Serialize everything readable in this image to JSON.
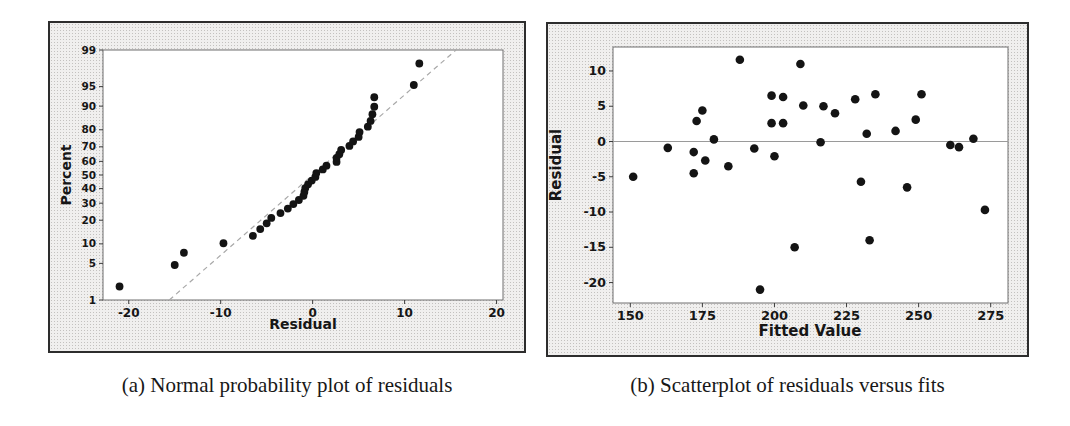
{
  "page": {
    "width": 1070,
    "height": 426,
    "background": "#ffffff"
  },
  "panels": {
    "a": {
      "caption": "(a) Normal probability plot of residuals"
    },
    "b": {
      "caption": "(b) Scatterplot of residuals versus fits"
    }
  },
  "style": {
    "panel_bg": "#f0efee",
    "panel_border": "#2d2d2d",
    "plot_bg": "#ffffff",
    "plot_border": "#6f6f6f",
    "point_color": "#141414",
    "ref_line_color": "#9a9a9a",
    "fit_line_color": "#a8a8a8",
    "tick_color": "#3c3c3c",
    "label_color": "#161616"
  },
  "chart_data": [
    {
      "id": "normal-probability-plot",
      "type": "scatter",
      "title": "",
      "xlabel": "Residual",
      "ylabel": "Percent",
      "y_scale": "normal-probability",
      "x_ticks": [
        -20,
        -10,
        0,
        10,
        20
      ],
      "y_ticks": [
        1,
        5,
        10,
        20,
        30,
        40,
        50,
        60,
        70,
        80,
        90,
        95,
        99
      ],
      "xlim": [
        -22.8,
        20.7
      ],
      "ylim_percent": [
        1,
        99
      ],
      "grid": false,
      "legend": "none",
      "fit_line": {
        "mean": 0,
        "sd": 6.7,
        "dashed": true
      },
      "point_format": [
        "residual",
        "percent"
      ],
      "points": [
        [
          -21.0,
          1.9
        ],
        [
          -15.0,
          4.7
        ],
        [
          -14.0,
          7.4
        ],
        [
          -9.7,
          10.2
        ],
        [
          -6.5,
          12.9
        ],
        [
          -5.7,
          15.7
        ],
        [
          -5.0,
          18.4
        ],
        [
          -4.5,
          21.2
        ],
        [
          -3.5,
          23.9
        ],
        [
          -2.7,
          26.6
        ],
        [
          -2.1,
          29.4
        ],
        [
          -1.5,
          32.1
        ],
        [
          -1.0,
          34.9
        ],
        [
          -0.9,
          37.6
        ],
        [
          -0.8,
          40.4
        ],
        [
          -0.5,
          43.1
        ],
        [
          -0.1,
          45.9
        ],
        [
          0.3,
          48.6
        ],
        [
          0.4,
          51.4
        ],
        [
          1.1,
          54.1
        ],
        [
          1.5,
          56.9
        ],
        [
          2.6,
          59.6
        ],
        [
          2.6,
          62.4
        ],
        [
          2.9,
          65.1
        ],
        [
          3.1,
          67.9
        ],
        [
          4.0,
          70.6
        ],
        [
          4.4,
          73.4
        ],
        [
          5.0,
          76.1
        ],
        [
          5.1,
          78.8
        ],
        [
          6.0,
          81.6
        ],
        [
          6.3,
          84.3
        ],
        [
          6.5,
          87.1
        ],
        [
          6.7,
          89.8
        ],
        [
          6.7,
          92.6
        ],
        [
          11.0,
          95.3
        ],
        [
          11.6,
          98.1
        ]
      ]
    },
    {
      "id": "residuals-versus-fits",
      "type": "scatter",
      "title": "",
      "xlabel": "Fitted Value",
      "ylabel": "Residual",
      "y_scale": "linear",
      "x_ticks": [
        150,
        175,
        200,
        225,
        250,
        275
      ],
      "y_ticks": [
        10,
        5,
        0,
        -5,
        -10,
        -15,
        -20
      ],
      "xlim": [
        144,
        281
      ],
      "ylim": [
        -22.9,
        13.4
      ],
      "grid": false,
      "legend": "none",
      "ref_line_y": 0,
      "point_format": [
        "fitted_value",
        "residual"
      ],
      "points": [
        [
          151,
          -5.0
        ],
        [
          163,
          -0.9
        ],
        [
          172,
          -1.5
        ],
        [
          172,
          -4.5
        ],
        [
          173,
          2.9
        ],
        [
          175,
          4.4
        ],
        [
          176,
          -2.7
        ],
        [
          179,
          0.3
        ],
        [
          184,
          -3.5
        ],
        [
          188,
          11.6
        ],
        [
          193,
          -1.0
        ],
        [
          195,
          -21.0
        ],
        [
          199,
          6.5
        ],
        [
          199,
          2.6
        ],
        [
          200,
          -2.1
        ],
        [
          203,
          6.3
        ],
        [
          203,
          2.6
        ],
        [
          207,
          -15.0
        ],
        [
          209,
          11.0
        ],
        [
          210,
          5.1
        ],
        [
          216,
          -0.1
        ],
        [
          217,
          5.0
        ],
        [
          221,
          4.0
        ],
        [
          228,
          6.0
        ],
        [
          230,
          -5.7
        ],
        [
          232,
          1.1
        ],
        [
          233,
          -14.0
        ],
        [
          235,
          6.7
        ],
        [
          242,
          1.5
        ],
        [
          246,
          -6.5
        ],
        [
          249,
          3.1
        ],
        [
          251,
          6.7
        ],
        [
          261,
          -0.5
        ],
        [
          264,
          -0.8
        ],
        [
          269,
          0.4
        ],
        [
          273,
          -9.7
        ]
      ]
    }
  ]
}
